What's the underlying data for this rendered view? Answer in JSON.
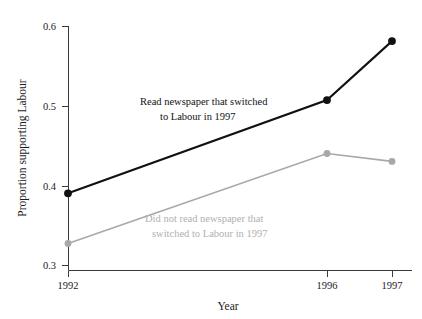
{
  "chart_data": {
    "type": "line",
    "title": "",
    "xlabel": "Year",
    "ylabel": "Proportion supporting Labour",
    "x": [
      1992,
      1996,
      1997
    ],
    "xtick_labels": [
      "1992",
      "1996",
      "1997"
    ],
    "ytick_labels": [
      "0.3",
      "0.4",
      "0.5",
      "0.6"
    ],
    "ytick_values": [
      0.3,
      0.4,
      0.5,
      0.6
    ],
    "ylim": [
      0.29,
      0.61
    ],
    "grid": false,
    "legend": "inline-annotations",
    "series": [
      {
        "name": "Read newspaper that switched to Labour in 1997",
        "color": "#111111",
        "values": [
          0.39,
          0.507,
          0.581
        ],
        "marker": "filled-circle"
      },
      {
        "name": "Did not read newspaper that switched to Labour in 1997",
        "color": "#a8a8a8",
        "values": [
          0.327,
          0.44,
          0.43
        ],
        "marker": "filled-circle"
      }
    ],
    "annotations": [
      {
        "id": "annotation-dark",
        "color": "#111111",
        "line1": "Read newspaper that switched",
        "line2": "to Labour in 1997"
      },
      {
        "id": "annotation-light",
        "color": "#b0b0b0",
        "line1": "Did not read newspaper that",
        "line2": "switched to Labour in 1997"
      }
    ]
  },
  "axes": {
    "y_title": "Proportion supporting Labour",
    "x_title": "Year",
    "ytick_0": "0.3",
    "ytick_1": "0.4",
    "ytick_2": "0.5",
    "ytick_3": "0.6",
    "xtick_0": "1992",
    "xtick_1": "1996",
    "xtick_2": "1997"
  },
  "annotations": {
    "dark_line1": "Read newspaper that switched",
    "dark_line2": "to Labour in 1997",
    "light_line1": "Did not read newspaper that",
    "light_line2": "switched to Labour in 1997"
  },
  "colors": {
    "series_dark": "#111111",
    "series_light": "#a8a8a8",
    "axis": "#3a3a3a",
    "background": "#ffffff"
  }
}
